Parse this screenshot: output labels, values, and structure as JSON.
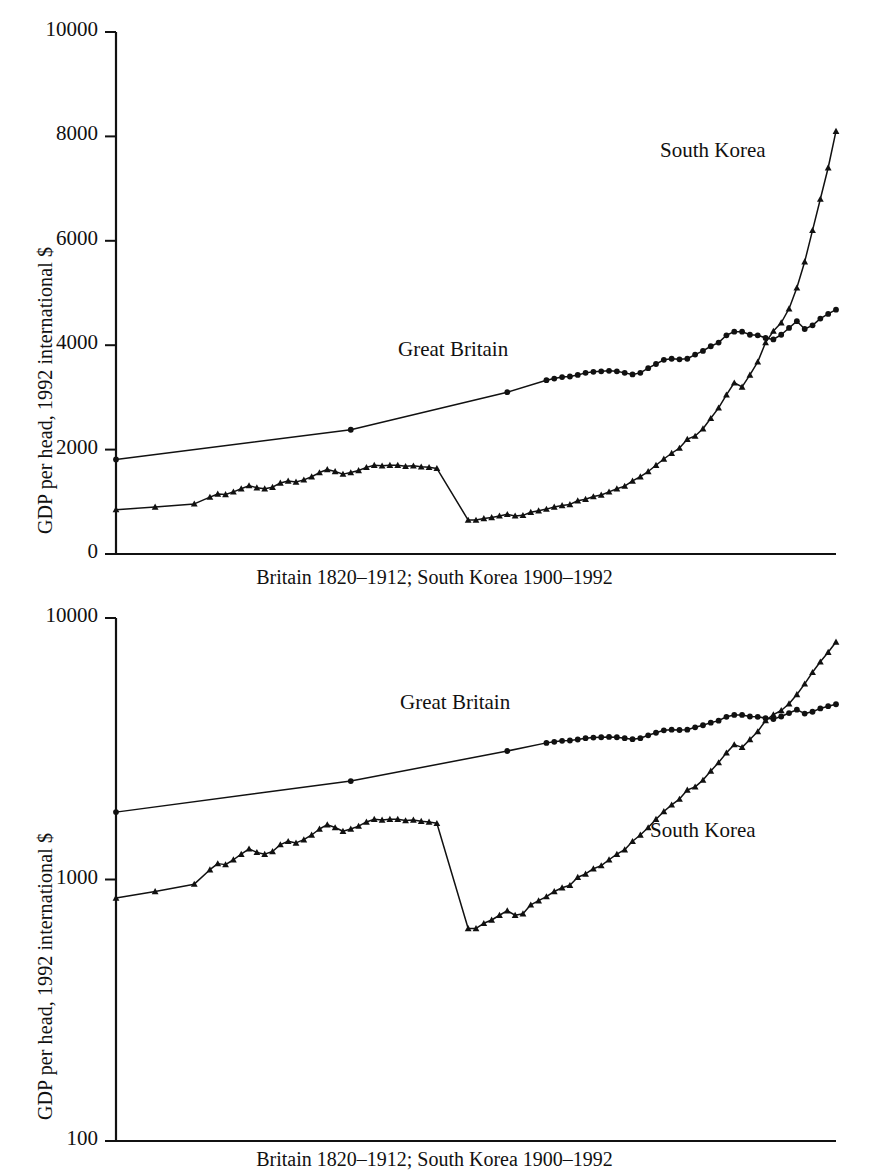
{
  "figure": {
    "ylabel": "GDP per head, 1992 international $",
    "series_labels": {
      "britain": "Great Britain",
      "korea": "South Korea"
    },
    "caption_top": "Britain 1820–1912; South Korea 1900–1992",
    "caption_bottom": "Britain 1820–1912; South Korea 1900–1992"
  },
  "chart_data": [
    {
      "type": "line",
      "panel": "top",
      "title": "",
      "subtitle": "",
      "xlabel": "Britain 1820–1912; South Korea 1900–1992",
      "ylabel": "GDP per head, 1992 international $",
      "yscale": "linear",
      "ylim": [
        0,
        10000
      ],
      "yticks": [
        0,
        2000,
        4000,
        6000,
        8000,
        10000
      ],
      "ytick_labels": [
        "0",
        "2000",
        "4000",
        "6000",
        "8000",
        "10000"
      ],
      "xticks": [],
      "xtick_labels": [],
      "grid": false,
      "legend": "inline-annotation",
      "annotations": [
        {
          "text": "Great Britain",
          "x": 1862,
          "y": 4450
        },
        {
          "text": "South Korea",
          "x": 1968,
          "y": 8150
        }
      ],
      "xlim": [
        1820,
        1912
      ],
      "series": [
        {
          "name": "Great Britain",
          "marker": "circle",
          "x_range": [
            1820,
            1912
          ],
          "x": [
            1820,
            1850,
            1870,
            1875,
            1876,
            1877,
            1878,
            1879,
            1880,
            1881,
            1882,
            1883,
            1884,
            1885,
            1886,
            1887,
            1888,
            1889,
            1890,
            1891,
            1892,
            1893,
            1894,
            1895,
            1896,
            1897,
            1898,
            1899,
            1900,
            1901,
            1902,
            1903,
            1904,
            1905,
            1906,
            1907,
            1908,
            1909,
            1910,
            1911,
            1912
          ],
          "values": [
            1810,
            2380,
            3100,
            3330,
            3360,
            3390,
            3400,
            3430,
            3470,
            3490,
            3500,
            3510,
            3500,
            3470,
            3440,
            3470,
            3560,
            3640,
            3720,
            3740,
            3730,
            3740,
            3820,
            3890,
            3980,
            4050,
            4190,
            4260,
            4260,
            4200,
            4190,
            4140,
            4110,
            4200,
            4330,
            4460,
            4310,
            4380,
            4510,
            4600,
            4680
          ]
        },
        {
          "name": "South Korea",
          "marker": "triangle",
          "x_range": [
            1900,
            1992
          ],
          "x": [
            1900,
            1905,
            1910,
            1912,
            1913,
            1914,
            1915,
            1916,
            1917,
            1918,
            1919,
            1920,
            1921,
            1922,
            1923,
            1924,
            1925,
            1926,
            1927,
            1928,
            1929,
            1930,
            1931,
            1932,
            1933,
            1934,
            1935,
            1936,
            1937,
            1938,
            1939,
            1940,
            1941,
            1945,
            1946,
            1947,
            1948,
            1949,
            1950,
            1951,
            1952,
            1953,
            1954,
            1955,
            1956,
            1957,
            1958,
            1959,
            1960,
            1961,
            1962,
            1963,
            1964,
            1965,
            1966,
            1967,
            1968,
            1969,
            1970,
            1971,
            1972,
            1973,
            1974,
            1975,
            1976,
            1977,
            1978,
            1979,
            1980,
            1981,
            1982,
            1983,
            1984,
            1985,
            1986,
            1987,
            1988,
            1989,
            1990,
            1991,
            1992
          ],
          "values": [
            850,
            900,
            960,
            1090,
            1150,
            1140,
            1190,
            1250,
            1310,
            1270,
            1250,
            1280,
            1360,
            1400,
            1380,
            1420,
            1480,
            1560,
            1620,
            1580,
            1530,
            1560,
            1600,
            1660,
            1700,
            1690,
            1700,
            1700,
            1680,
            1690,
            1670,
            1660,
            1640,
            650,
            650,
            680,
            700,
            730,
            760,
            730,
            740,
            800,
            830,
            860,
            900,
            930,
            950,
            1020,
            1050,
            1100,
            1130,
            1190,
            1250,
            1300,
            1400,
            1480,
            1580,
            1700,
            1820,
            1930,
            2030,
            2200,
            2260,
            2400,
            2600,
            2800,
            3050,
            3280,
            3200,
            3430,
            3680,
            4050,
            4270,
            4430,
            4700,
            5100,
            5600,
            6200,
            6800,
            7400,
            8100,
            9900
          ]
        }
      ]
    },
    {
      "type": "line",
      "panel": "bottom",
      "title": "",
      "subtitle": "",
      "xlabel": "Britain 1820–1912; South Korea 1900–1992",
      "ylabel": "GDP per head, 1992 international $",
      "yscale": "log",
      "ylim": [
        100,
        10000
      ],
      "yticks": [
        100,
        1000,
        10000
      ],
      "ytick_labels": [
        "100",
        "1000",
        "10000"
      ],
      "xticks": [],
      "xtick_labels": [],
      "grid": false,
      "legend": "inline-annotation",
      "annotations": [
        {
          "text": "Great Britain",
          "x": 1862,
          "y": 4600
        },
        {
          "text": "South Korea",
          "x": 1970,
          "y": 1550
        }
      ],
      "xlim": [
        1820,
        1912
      ],
      "series": [
        {
          "name": "Great Britain",
          "marker": "circle",
          "x_range": [
            1820,
            1912
          ],
          "x": [
            1820,
            1850,
            1870,
            1875,
            1876,
            1877,
            1878,
            1879,
            1880,
            1881,
            1882,
            1883,
            1884,
            1885,
            1886,
            1887,
            1888,
            1889,
            1890,
            1891,
            1892,
            1893,
            1894,
            1895,
            1896,
            1897,
            1898,
            1899,
            1900,
            1901,
            1902,
            1903,
            1904,
            1905,
            1906,
            1907,
            1908,
            1909,
            1910,
            1911,
            1912
          ],
          "values": [
            1810,
            2380,
            3100,
            3330,
            3360,
            3390,
            3400,
            3430,
            3470,
            3490,
            3500,
            3510,
            3500,
            3470,
            3440,
            3470,
            3560,
            3640,
            3720,
            3740,
            3730,
            3740,
            3820,
            3890,
            3980,
            4050,
            4190,
            4260,
            4260,
            4200,
            4190,
            4140,
            4110,
            4200,
            4330,
            4460,
            4310,
            4380,
            4510,
            4600,
            4680
          ]
        },
        {
          "name": "South Korea",
          "marker": "triangle",
          "x_range": [
            1900,
            1992
          ],
          "x": [
            1900,
            1905,
            1910,
            1912,
            1913,
            1914,
            1915,
            1916,
            1917,
            1918,
            1919,
            1920,
            1921,
            1922,
            1923,
            1924,
            1925,
            1926,
            1927,
            1928,
            1929,
            1930,
            1931,
            1932,
            1933,
            1934,
            1935,
            1936,
            1937,
            1938,
            1939,
            1940,
            1941,
            1945,
            1946,
            1947,
            1948,
            1949,
            1950,
            1951,
            1952,
            1953,
            1954,
            1955,
            1956,
            1957,
            1958,
            1959,
            1960,
            1961,
            1962,
            1963,
            1964,
            1965,
            1966,
            1967,
            1968,
            1969,
            1970,
            1971,
            1972,
            1973,
            1974,
            1975,
            1976,
            1977,
            1978,
            1979,
            1980,
            1981,
            1982,
            1983,
            1984,
            1985,
            1986,
            1987,
            1988,
            1989,
            1990,
            1991,
            1992
          ],
          "values": [
            850,
            900,
            960,
            1090,
            1150,
            1140,
            1190,
            1250,
            1310,
            1270,
            1250,
            1280,
            1360,
            1400,
            1380,
            1420,
            1480,
            1560,
            1620,
            1580,
            1530,
            1560,
            1600,
            1660,
            1700,
            1690,
            1700,
            1700,
            1680,
            1690,
            1670,
            1660,
            1640,
            650,
            650,
            680,
            700,
            730,
            760,
            730,
            740,
            800,
            830,
            860,
            900,
            930,
            950,
            1020,
            1050,
            1100,
            1130,
            1190,
            1250,
            1300,
            1400,
            1480,
            1580,
            1700,
            1820,
            1930,
            2030,
            2200,
            2260,
            2400,
            2600,
            2800,
            3050,
            3280,
            3200,
            3430,
            3680,
            4050,
            4270,
            4430,
            4700,
            5100,
            5600,
            6200,
            6800,
            7400,
            8100,
            9900
          ]
        }
      ]
    }
  ]
}
